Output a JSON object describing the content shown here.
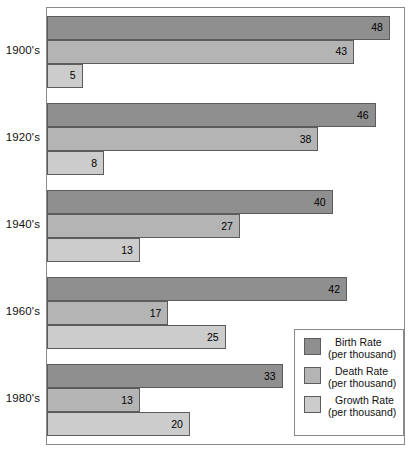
{
  "chart_data": {
    "type": "bar",
    "orientation": "horizontal",
    "title": "",
    "subtitle": "",
    "xlabel": "",
    "ylabel": "",
    "categories": [
      "1900's",
      "1920's",
      "1940's",
      "1960's",
      "1980's"
    ],
    "series": [
      {
        "name": "Birth Rate",
        "unit": "(per thousand)",
        "color": "#8f8f8f",
        "values": [
          48,
          46,
          40,
          42,
          33
        ]
      },
      {
        "name": "Death Rate",
        "unit": "(per thousand)",
        "color": "#b4b4b4",
        "values": [
          43,
          38,
          27,
          17,
          13
        ]
      },
      {
        "name": "Growth Rate",
        "unit": "(per thousand)",
        "color": "#cccccc",
        "values": [
          5,
          8,
          13,
          25,
          20
        ]
      }
    ],
    "value_labels_shown": true,
    "xlim": [
      0,
      49
    ],
    "grid": false,
    "legend_position": "bottom-right",
    "frame_border_color": "#8a8a8a",
    "bar_border_color": "#5c5c5c",
    "background": "#ffffff"
  },
  "legend": {
    "entries": [
      {
        "label": "Birth Rate",
        "sub": "(per thousand)",
        "swatch": "#8f8f8f"
      },
      {
        "label": "Death Rate",
        "sub": "(per thousand)",
        "swatch": "#b4b4b4"
      },
      {
        "label": "Growth Rate",
        "sub": "(per thousand)",
        "swatch": "#cccccc"
      }
    ]
  }
}
